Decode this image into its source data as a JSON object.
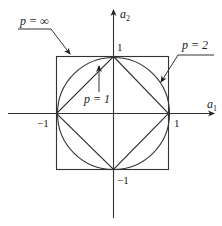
{
  "diagram": {
    "title": "",
    "axes": {
      "x_label": "a",
      "x_sub": "1",
      "y_label": "a",
      "y_sub": "2"
    },
    "ticks": {
      "x_pos": "1",
      "x_neg": "−1",
      "y_pos": "1",
      "y_neg": "−1"
    },
    "curves": [
      {
        "name": "p-infinity",
        "label": "p = ∞",
        "shape": "square"
      },
      {
        "name": "p-2",
        "label": "p = 2",
        "shape": "circle"
      },
      {
        "name": "p-1",
        "label": "p = 1",
        "shape": "diamond"
      }
    ],
    "colors": {
      "stroke": "#333333",
      "text": "#222222",
      "background": "#ffffff"
    }
  }
}
